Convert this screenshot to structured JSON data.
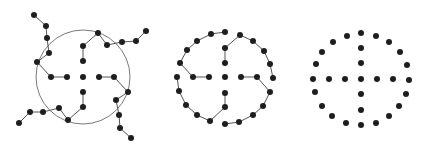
{
  "diagram": {
    "colors": {
      "node": "#1e1e1e",
      "edge": "#555555",
      "circle": "#7a7a7a",
      "background": "#ffffff"
    },
    "node_radius": 3,
    "panels": [
      {
        "id": "panel-1-tree-with-circle",
        "circle": {
          "cx": 83,
          "cy": 77,
          "r": 47
        },
        "nodes": [
          [
            34,
            15
          ],
          [
            46,
            26
          ],
          [
            47,
            38
          ],
          [
            49,
            53
          ],
          [
            37,
            62
          ],
          [
            51,
            77
          ],
          [
            67,
            77
          ],
          [
            83,
            77
          ],
          [
            99,
            77
          ],
          [
            114,
            77
          ],
          [
            128,
            92
          ],
          [
            116,
            100
          ],
          [
            119,
            115
          ],
          [
            120,
            128
          ],
          [
            131,
            138
          ],
          [
            83,
            61
          ],
          [
            83,
            46
          ],
          [
            98,
            33
          ],
          [
            107,
            45
          ],
          [
            122,
            42
          ],
          [
            136,
            41
          ],
          [
            146,
            31
          ],
          [
            83,
            92
          ],
          [
            83,
            107
          ],
          [
            68,
            120
          ],
          [
            59,
            108
          ],
          [
            43,
            112
          ],
          [
            30,
            112
          ],
          [
            19,
            123
          ]
        ],
        "edges": [
          [
            0,
            1
          ],
          [
            1,
            2
          ],
          [
            2,
            3
          ],
          [
            3,
            4
          ],
          [
            4,
            5
          ],
          [
            5,
            6
          ],
          [
            8,
            9
          ],
          [
            9,
            10
          ],
          [
            10,
            11
          ],
          [
            11,
            12
          ],
          [
            12,
            13
          ],
          [
            13,
            14
          ],
          [
            15,
            16
          ],
          [
            16,
            17
          ],
          [
            17,
            18
          ],
          [
            18,
            19
          ],
          [
            19,
            20
          ],
          [
            20,
            21
          ],
          [
            22,
            23
          ],
          [
            23,
            24
          ],
          [
            24,
            25
          ],
          [
            25,
            26
          ],
          [
            26,
            27
          ],
          [
            27,
            28
          ]
        ]
      },
      {
        "id": "panel-2-tree-folded",
        "circle": null,
        "nodes": [
          [
            225,
            77
          ],
          [
            225,
            63
          ],
          [
            225,
            48
          ],
          [
            240,
            35
          ],
          [
            253,
            41
          ],
          [
            264,
            51
          ],
          [
            270,
            64
          ],
          [
            273,
            78
          ],
          [
            209,
            77
          ],
          [
            193,
            77
          ],
          [
            180,
            63
          ],
          [
            187,
            50
          ],
          [
            197,
            41
          ],
          [
            211,
            34
          ],
          [
            225,
            32
          ],
          [
            241,
            77
          ],
          [
            257,
            77
          ],
          [
            270,
            92
          ],
          [
            263,
            106
          ],
          [
            253,
            115
          ],
          [
            239,
            122
          ],
          [
            225,
            124
          ],
          [
            177,
            77
          ],
          [
            179,
            91
          ],
          [
            186,
            105
          ],
          [
            197,
            115
          ],
          [
            210,
            121
          ],
          [
            225,
            107
          ],
          [
            225,
            93
          ]
        ],
        "edges": [
          [
            1,
            2
          ],
          [
            2,
            3
          ],
          [
            3,
            4
          ],
          [
            4,
            5
          ],
          [
            5,
            6
          ],
          [
            6,
            7
          ],
          [
            8,
            9
          ],
          [
            9,
            10
          ],
          [
            10,
            11
          ],
          [
            11,
            12
          ],
          [
            12,
            13
          ],
          [
            13,
            14
          ],
          [
            15,
            16
          ],
          [
            16,
            17
          ],
          [
            17,
            18
          ],
          [
            18,
            19
          ],
          [
            19,
            20
          ],
          [
            20,
            21
          ],
          [
            22,
            23
          ],
          [
            23,
            24
          ],
          [
            24,
            25
          ],
          [
            25,
            26
          ],
          [
            26,
            27
          ],
          [
            27,
            28
          ]
        ]
      },
      {
        "id": "panel-3-points-only",
        "circle": null,
        "nodes": [
          [
            361,
            79
          ],
          [
            345,
            79
          ],
          [
            329,
            79
          ],
          [
            377,
            79
          ],
          [
            393,
            79
          ],
          [
            361,
            63
          ],
          [
            361,
            48
          ],
          [
            361,
            94
          ],
          [
            361,
            110
          ],
          [
            361,
            33
          ],
          [
            347,
            36
          ],
          [
            376,
            36
          ],
          [
            333,
            42
          ],
          [
            389,
            42
          ],
          [
            322,
            52
          ],
          [
            400,
            52
          ],
          [
            316,
            64
          ],
          [
            407,
            65
          ],
          [
            313,
            79
          ],
          [
            409,
            80
          ],
          [
            315,
            92
          ],
          [
            406,
            94
          ],
          [
            322,
            106
          ],
          [
            399,
            106
          ],
          [
            332,
            116
          ],
          [
            389,
            116
          ],
          [
            346,
            123
          ],
          [
            376,
            123
          ],
          [
            361,
            125
          ]
        ],
        "edges": []
      }
    ]
  }
}
